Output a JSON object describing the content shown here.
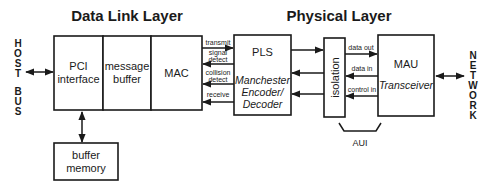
{
  "titles": {
    "data_link_layer": "Data Link Layer",
    "physical_layer": "Physical Layer"
  },
  "side_labels": {
    "host": [
      "H",
      "O",
      "S",
      "T"
    ],
    "bus": [
      "B",
      "U",
      "S"
    ],
    "network": [
      "N",
      "E",
      "T",
      "W",
      "O",
      "R",
      "K"
    ]
  },
  "blocks": {
    "pci": {
      "line1": "PCI",
      "line2": "interface"
    },
    "message_buffer": {
      "line1": "message",
      "line2": "buffer"
    },
    "mac": {
      "label": "MAC"
    },
    "buffer_memory": {
      "line1": "buffer",
      "line2": "memory"
    },
    "pls": {
      "label": "PLS",
      "sub1": "Manchester",
      "sub2": "Encoder/",
      "sub3": "Decoder"
    },
    "isolation": {
      "label": "isolation"
    },
    "mau": {
      "label": "MAU",
      "sub": "Transceiver"
    }
  },
  "signals_mac_pls": {
    "transmit": "transmit",
    "signal_detect_1": "signal",
    "signal_detect_2": "detect",
    "collision_detect_1": "collision",
    "collision_detect_2": "detect",
    "receive": "receive"
  },
  "signals_aui": {
    "data_out": "data out",
    "data_in": "data in",
    "control_in": "control in"
  },
  "aui_label": "AUI"
}
